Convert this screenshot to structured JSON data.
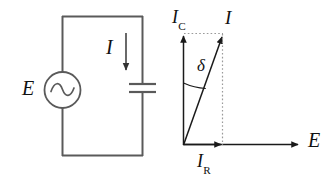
{
  "figure": {
    "background_color": "#ffffff",
    "line_color": "#555555",
    "dark_line_color": "#1a1a1a",
    "dotted_color": "#999999",
    "text_color": "#111111"
  },
  "circuit": {
    "name": "ac-source-capacitor-circuit",
    "source_label": "E",
    "current_label": "I",
    "source_symbol": "sine-wave",
    "component": "capacitor",
    "loop": {
      "left": 62,
      "top": 16,
      "right": 143,
      "bottom": 156
    }
  },
  "phasor": {
    "name": "phasor-diagram",
    "origin": {
      "x": 183,
      "y": 145
    },
    "vertical_axis_label": "I",
    "vertical_axis_subscript": "C",
    "horizontal_axis_label": "E",
    "resultant_label": "I",
    "resistive_label": "I",
    "resistive_subscript": "R",
    "angle_label": "δ",
    "vectors": [
      {
        "name": "Ic",
        "label": "I",
        "subscript": "C",
        "tip_x": 184,
        "tip_y": 34,
        "style": "solid"
      },
      {
        "name": "I",
        "label": "I",
        "subscript": "",
        "tip_x": 223,
        "tip_y": 34,
        "style": "solid"
      },
      {
        "name": "Ir",
        "label": "I",
        "subscript": "R",
        "tip_x": 223,
        "tip_y": 145,
        "style": "solid"
      },
      {
        "name": "E",
        "label": "E",
        "subscript": "",
        "tip_x": 300,
        "tip_y": 145,
        "style": "solid"
      }
    ],
    "projection_lines": [
      {
        "name": "horizontal-projection",
        "from_x": 184,
        "from_y": 33,
        "to_x": 223,
        "to_y": 33
      },
      {
        "name": "vertical-projection",
        "from_x": 223,
        "from_y": 34,
        "to_x": 223,
        "to_y": 145
      }
    ],
    "angle_arc_degrees": 19
  }
}
